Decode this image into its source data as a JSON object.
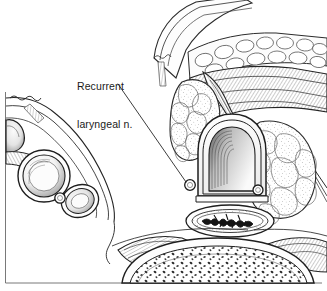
{
  "figure": {
    "kind": "anatomical-line-drawing",
    "background_color": "#ffffff",
    "ink_color": "#1a1a1a",
    "frame": {
      "present": true,
      "left_x": 5,
      "bottom_y": 283,
      "top_y": 92,
      "right_x": 322,
      "color": "#555555"
    }
  },
  "labels": [
    {
      "id": "recurrent-laryngeal-nerve",
      "line1": "Recurrent",
      "line2": "laryngeal n.",
      "full_text": "Recurrent laryngeal n.",
      "x": 77,
      "y": 55,
      "font_size_px": 10.5,
      "color": "#1a1a1a",
      "leader": {
        "from_x": 118,
        "from_y": 84,
        "to_x": 190,
        "to_y": 185,
        "target": "nerve-circle-left"
      }
    }
  ],
  "structures": [
    {
      "id": "strap-muscle-superior",
      "name": "Strap muscle (superior sweep)",
      "region": "top-center"
    },
    {
      "id": "sternocleidomastoid",
      "name": "Sternocleidomastoid muscle",
      "region": "upper-right"
    },
    {
      "id": "thyroid-lobe-left",
      "name": "Thyroid gland lobe (left of lumen)",
      "region": "center-left"
    },
    {
      "id": "thyroid-lobe-right",
      "name": "Thyroid gland lobe (right of lumen)",
      "region": "center-right"
    },
    {
      "id": "cricoid-lumen",
      "name": "Cricoid / tracheal lumen",
      "region": "center"
    },
    {
      "id": "nerve-circle-left",
      "name": "Recurrent laryngeal nerve (left)",
      "region": "center-left-lumen"
    },
    {
      "id": "nerve-circle-right",
      "name": "Recurrent laryngeal nerve (right)",
      "region": "center-right-lumen"
    },
    {
      "id": "esophagus",
      "name": "Esophagus with stellate lumen",
      "region": "lower-center"
    },
    {
      "id": "vertebral-body",
      "name": "Vertebral body (cancellous bone)",
      "region": "bottom-center"
    },
    {
      "id": "longus-colli-left",
      "name": "Longus colli muscle (left)",
      "region": "bottom-left"
    },
    {
      "id": "longus-colli-right",
      "name": "Longus colli muscle (right)",
      "region": "bottom-right"
    },
    {
      "id": "carotid-artery",
      "name": "Common carotid artery",
      "region": "left"
    },
    {
      "id": "jugular-vein",
      "name": "Internal jugular vein",
      "region": "left-lower"
    },
    {
      "id": "vagus-nerve",
      "name": "Vagus nerve",
      "region": "left-between-vessels"
    },
    {
      "id": "carotid-sheath",
      "name": "Carotid sheath / fascial planes",
      "region": "left"
    }
  ]
}
